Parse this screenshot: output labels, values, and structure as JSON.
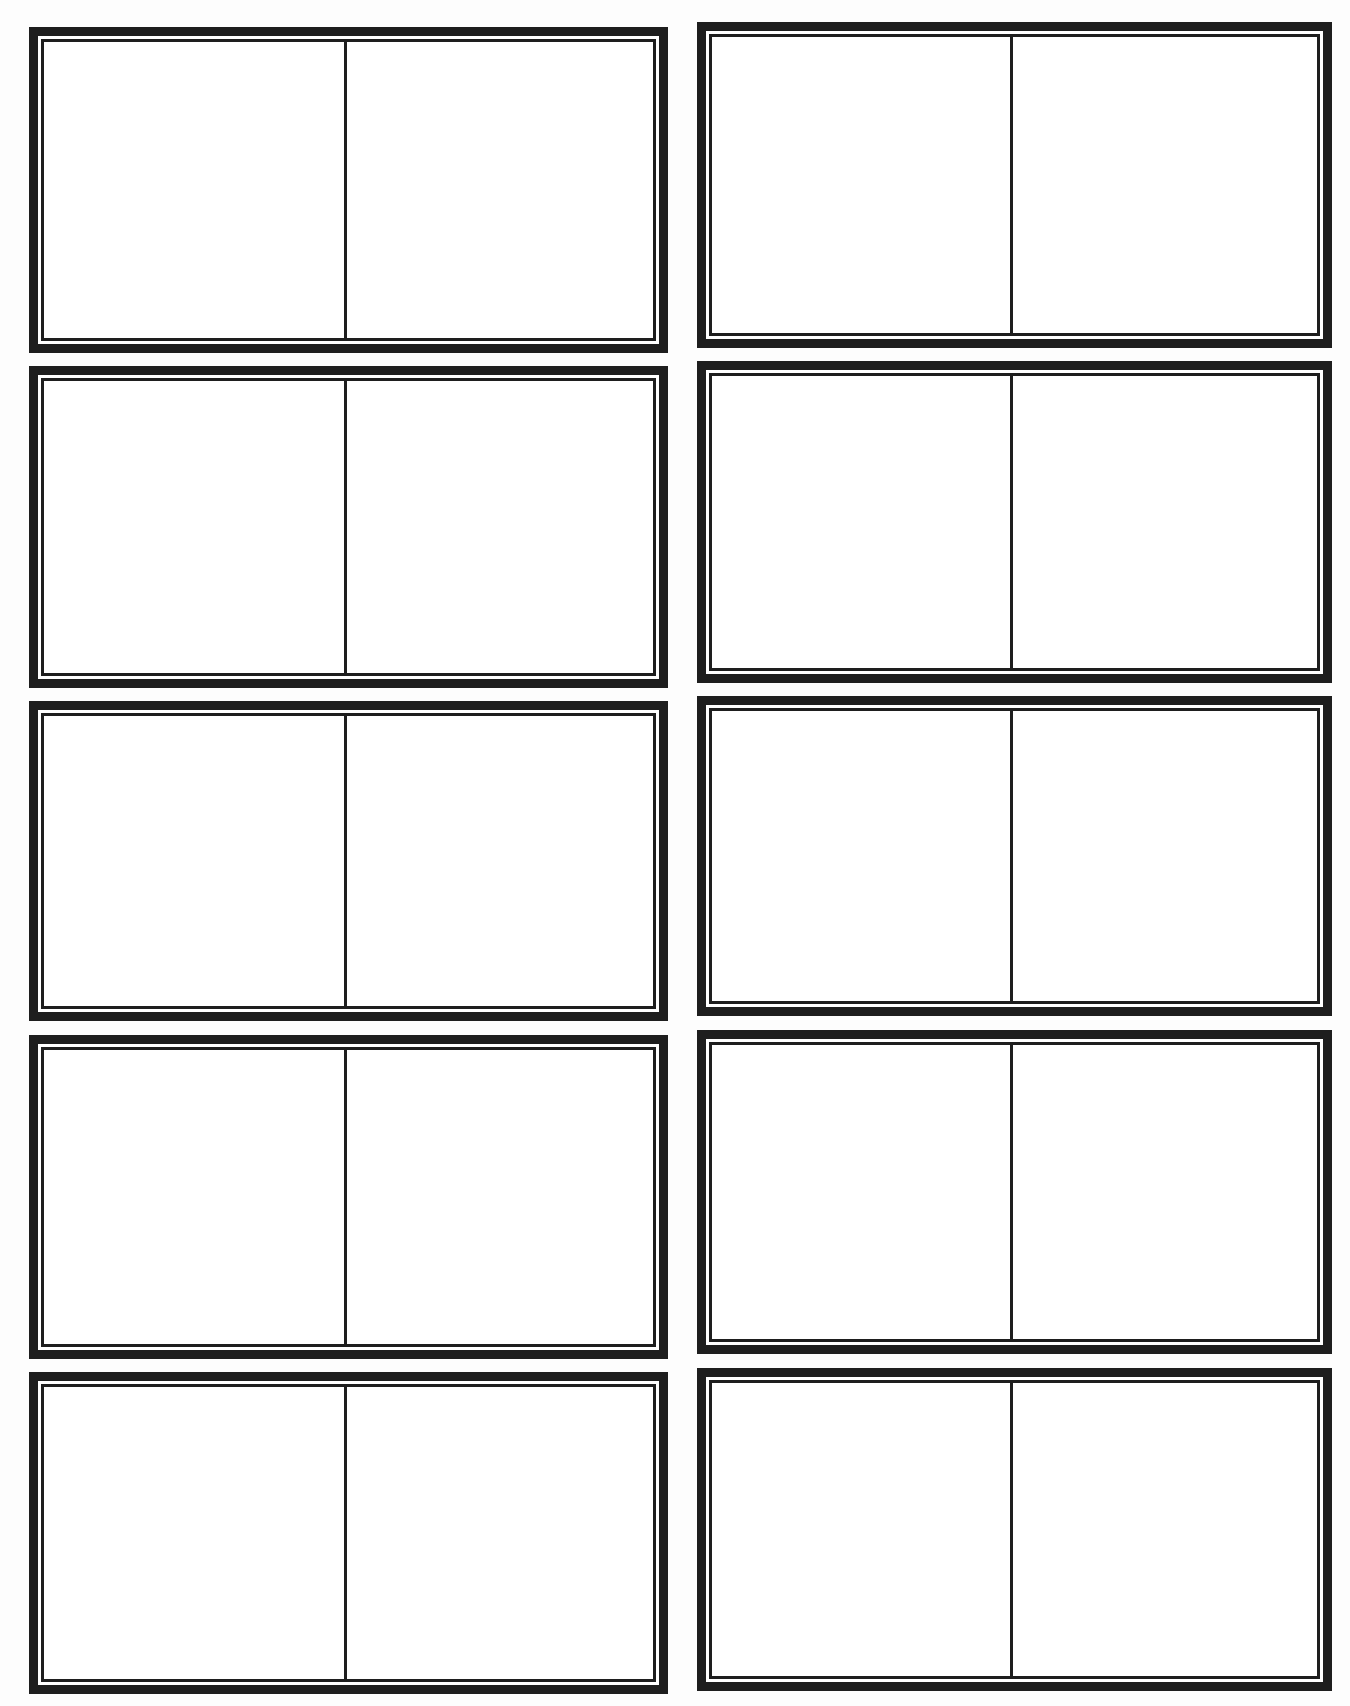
{
  "sheet": {
    "type": "blank-card-template",
    "columns": 2,
    "rows": 5,
    "border_color": "#1e1e1e",
    "background_color": "#ffffff",
    "cards": [
      {
        "id": "card-1",
        "column": 1,
        "row": 1,
        "left": 29,
        "top": 27,
        "width": 639,
        "height": 326,
        "divider_x": 345
      },
      {
        "id": "card-2",
        "column": 2,
        "row": 1,
        "left": 697,
        "top": 22,
        "width": 635,
        "height": 326,
        "divider_x": 1011
      },
      {
        "id": "card-3",
        "column": 1,
        "row": 2,
        "left": 29,
        "top": 366,
        "width": 639,
        "height": 322,
        "divider_x": 345
      },
      {
        "id": "card-4",
        "column": 2,
        "row": 2,
        "left": 697,
        "top": 361,
        "width": 635,
        "height": 322,
        "divider_x": 1011
      },
      {
        "id": "card-5",
        "column": 1,
        "row": 3,
        "left": 29,
        "top": 701,
        "width": 639,
        "height": 320,
        "divider_x": 345
      },
      {
        "id": "card-6",
        "column": 2,
        "row": 3,
        "left": 697,
        "top": 696,
        "width": 635,
        "height": 320,
        "divider_x": 1011
      },
      {
        "id": "card-7",
        "column": 1,
        "row": 4,
        "left": 29,
        "top": 1035,
        "width": 639,
        "height": 324,
        "divider_x": 345
      },
      {
        "id": "card-8",
        "column": 2,
        "row": 4,
        "left": 697,
        "top": 1030,
        "width": 635,
        "height": 324,
        "divider_x": 1011
      },
      {
        "id": "card-9",
        "column": 1,
        "row": 5,
        "left": 29,
        "top": 1372,
        "width": 639,
        "height": 322,
        "divider_x": 345
      },
      {
        "id": "card-10",
        "column": 2,
        "row": 5,
        "left": 697,
        "top": 1368,
        "width": 635,
        "height": 323,
        "divider_x": 1011
      }
    ]
  }
}
